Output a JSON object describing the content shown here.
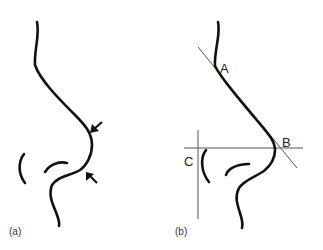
{
  "figure": {
    "panels": [
      {
        "id": "a",
        "caption": "(a)",
        "annotations": [
          "arrow-upper",
          "arrow-lower"
        ]
      },
      {
        "id": "b",
        "caption": "(b)",
        "points": [
          {
            "label": "A"
          },
          {
            "label": "B"
          },
          {
            "label": "C"
          }
        ]
      }
    ],
    "colors": {
      "stroke": "#111111",
      "guide": "#555555",
      "background": "#ffffff"
    }
  }
}
